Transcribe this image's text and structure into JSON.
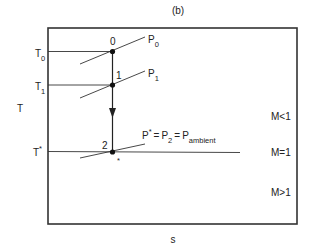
{
  "figure": {
    "panel_label": "(b)",
    "x_axis_label": "s",
    "y_axis_label": "T"
  },
  "temperature_levels": [
    {
      "id": "T0",
      "base": "T",
      "sub": "0",
      "sup": ""
    },
    {
      "id": "T1",
      "base": "T",
      "sub": "1",
      "sup": ""
    },
    {
      "id": "Tstar",
      "base": "T",
      "sub": "",
      "sup": "*"
    }
  ],
  "states": [
    {
      "id": "0",
      "label": "0"
    },
    {
      "id": "1",
      "label": "1"
    },
    {
      "id": "2",
      "label": "2"
    },
    {
      "id": "star",
      "label": "*"
    }
  ],
  "isobars": [
    {
      "id": "P0",
      "base": "P",
      "sub": "0"
    },
    {
      "id": "P1",
      "base": "P",
      "sub": "1"
    },
    {
      "id": "P2",
      "expression": {
        "p1_base": "P",
        "p1_sup": "*",
        "eq1": "=",
        "p2_base": "P",
        "p2_sub": "2",
        "eq2": "=",
        "p3_base": "P",
        "p3_sub": "ambient"
      }
    }
  ],
  "mach_regions": [
    {
      "id": "subsonic",
      "label": "M<1"
    },
    {
      "id": "sonic",
      "label": "M=1"
    },
    {
      "id": "supersonic",
      "label": "M>1"
    }
  ],
  "colors": {
    "line": "#333333",
    "background": "#ffffff"
  }
}
